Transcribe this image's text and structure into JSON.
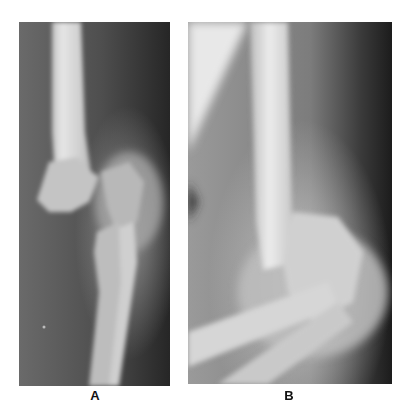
{
  "figure": {
    "panels": [
      {
        "id": "A",
        "label": "A",
        "description": "Anteroposterior radiograph of elbow showing distal humerus fracture"
      },
      {
        "id": "B",
        "label": "B",
        "description": "Lateral radiograph of elbow showing distal humerus fracture"
      }
    ]
  }
}
